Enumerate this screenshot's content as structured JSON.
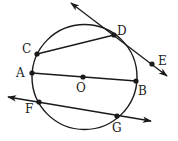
{
  "diagram": {
    "type": "circle-geometry",
    "stroke_color": "#1a1a1a",
    "background": "#ffffff",
    "circle": {
      "center_label": "O",
      "cx": 84.5,
      "cy": 77,
      "r": 52.5
    },
    "points": {
      "A": {
        "label": "A",
        "x": 32,
        "y": 73
      },
      "B": {
        "label": "B",
        "x": 136,
        "y": 81
      },
      "C": {
        "label": "C",
        "x": 37,
        "y": 54
      },
      "D": {
        "label": "D",
        "x": 114,
        "y": 35
      },
      "E": {
        "label": "E",
        "x": 152,
        "y": 64
      },
      "F": {
        "label": "F",
        "x": 39,
        "y": 102
      },
      "G": {
        "label": "G",
        "x": 117,
        "y": 116
      },
      "O": {
        "label": "O",
        "x": 83,
        "y": 77
      }
    },
    "segments": [
      {
        "name": "chord-CD",
        "from": "C",
        "to": "D"
      },
      {
        "name": "diameter-AB",
        "from": "A",
        "to": "B"
      }
    ],
    "lines": [
      {
        "name": "tangent-line-DE",
        "through": [
          "D",
          "E"
        ],
        "arrows": "both"
      },
      {
        "name": "secant-line-FG",
        "through": [
          "F",
          "G"
        ],
        "arrows": "both"
      }
    ]
  }
}
